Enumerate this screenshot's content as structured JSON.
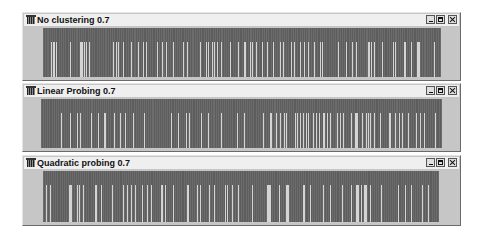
{
  "windows": [
    {
      "title": "No clustering 0.7",
      "top": 12,
      "height": 69,
      "plot_left": 20,
      "plot_width": 398,
      "controls": [
        "minimize",
        "maximize",
        "close"
      ],
      "slots": "1111111110100101111111111111110111111111100010101110111111011111111111111111101110101111011111111011101110111101110111111111110111101011011111101111111111101110111110111111101111110101111010110111011111111101111111101111110011110110111011110101111011011101111111011011111101011011111101110111011111101111110101111111111111111101111111011111101110111111111111100101101111111101111111111101011111111100111111011111100011111111111111100111111"
    },
    {
      "title": "Linear Probing 0.7",
      "top": 83,
      "height": 69,
      "plot_left": 18,
      "plot_width": 400,
      "controls": [
        "minimize",
        "maximize",
        "close"
      ],
      "slots": "1111111111111111111110111111110111111101101111111111011111110111110011111111101111101111011111111011111111110111111111111111111111111111011111110111111101101111111111110111111011111111111110111111111111111101111110111111111111111111101111110011111011101110101111111110101101101101011110111011011100110110111111101101101111111011100001111011101010111011111101111111100111101111011011111011111110111101110111111111101111111"
    },
    {
      "title": "Quadratic probing 0.7",
      "top": 155,
      "height": 71,
      "plot_left": 20,
      "plot_width": 396,
      "controls": [
        "minimize",
        "maximize",
        "close"
      ],
      "slots": "1110111011111111111111111110001111101011101111111111110011110111111111101111111101101110111011101111110111101110111111111100110111111101111111111111100111111110110111111110111100111111111101011110111110111111111111110111111111111110000111110111011111100011111111111111001111110111111111111011111101111111011110111111110111100011011000110101111111111011111111111111110111111101111101111111111011111011111111111"
    }
  ],
  "colors": {
    "window_face": "#c6c6c6",
    "titlebar": "#efefef",
    "occupied_slot": "#5d5d5d",
    "empty_slot": "#d4d4d4"
  }
}
